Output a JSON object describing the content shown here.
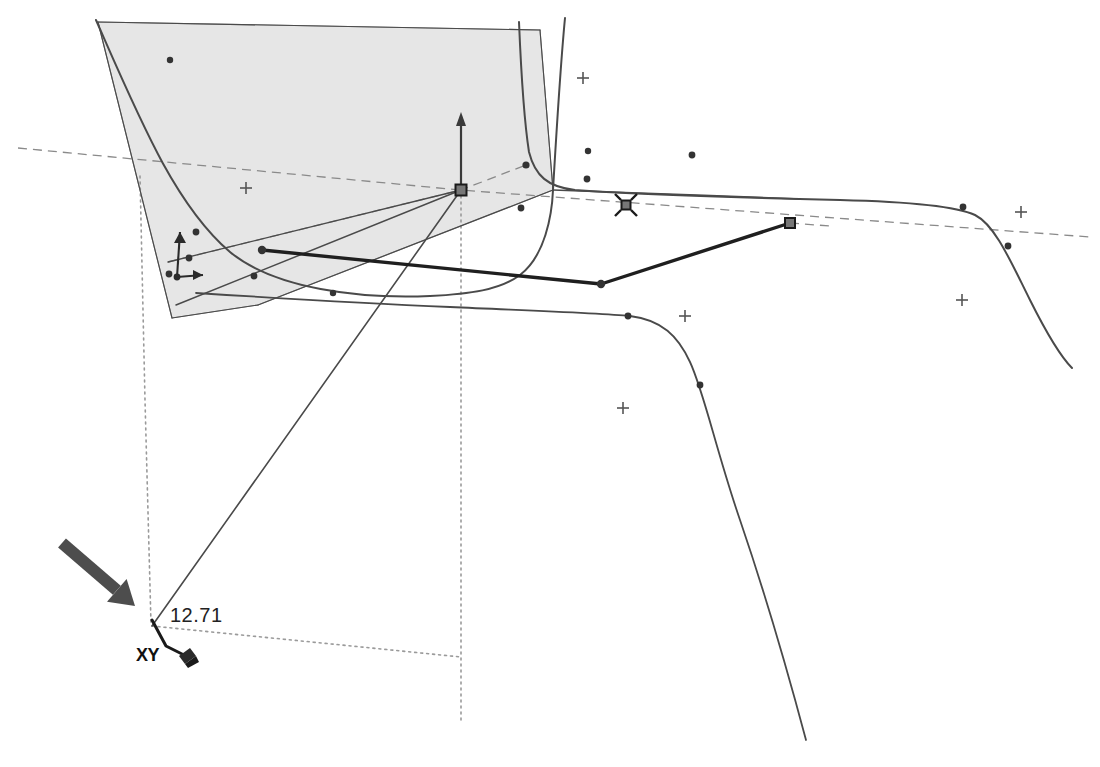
{
  "app": {
    "kind": "cad-3d-viewport",
    "background_color": "#ffffff"
  },
  "annotations": {
    "dimension_value": "12.71",
    "axis_lock_label": "XY",
    "pointer_arrow_name": "callout-arrow",
    "pencil_cursor_name": "pencil-cursor-icon"
  },
  "colors": {
    "face_fill": "#e6e6e6",
    "face_edge": "#8f8f8f",
    "geometry_stroke": "#4a4a4a",
    "selected_stroke": "#1f1f1f",
    "guide_dotted": "#9a9a9a",
    "guide_dashed": "#8a8a8a",
    "vertex_fill": "#333333",
    "handle_fill": "#555555",
    "callout_arrow": "#4d4d4d",
    "text": "#1a1a1a"
  },
  "geometry": {
    "shaded_face": {
      "name": "shaded-face-polygon",
      "points": "98,22 540,30 553,190 258,305 172,318"
    },
    "curves": [
      {
        "name": "curve-upper-left",
        "d": "M 96,20 C 140,120 175,205 230,252 C 275,289 360,299 430,296 C 470,294 500,290 520,275 C 545,256 552,215 553,190 C 556,140 560,70 565,18",
        "width": 2.0
      },
      {
        "name": "curve-top-right-sweep",
        "d": "M 519,22 C 521,70 524,120 529,152 C 535,176 548,187 575,190 C 640,195 760,198 840,200 C 920,202 960,208 975,215 C 995,225 1010,260 1030,300 C 1048,336 1062,358 1072,368",
        "width": 2.0
      },
      {
        "name": "curve-lower-right-sweep",
        "d": "M 196,293 C 260,297 360,303 450,307 C 540,311 600,313 630,316 C 662,320 678,336 690,362 C 704,392 716,450 740,520 C 766,596 790,680 806,740",
        "width": 1.8
      },
      {
        "name": "curve-right-tail",
        "d": "M 553,190 C 620,192 720,196 800,199",
        "width": 1.6
      }
    ],
    "lines": [
      {
        "name": "edge-origin-to-bottom-left",
        "x1": 461,
        "y1": 190,
        "x2": 152,
        "y2": 626,
        "width": 1.6
      },
      {
        "name": "edge-origin-to-lower-left",
        "x1": 461,
        "y1": 190,
        "x2": 176,
        "y2": 305,
        "width": 1.5
      },
      {
        "name": "edge-origin-to-left-mid",
        "x1": 461,
        "y1": 190,
        "x2": 168,
        "y2": 262,
        "width": 1.3
      },
      {
        "name": "edge-face-lower-right",
        "x1": 258,
        "y1": 305,
        "x2": 553,
        "y2": 190,
        "width": 1.2
      },
      {
        "name": "edge-face-left-diag",
        "x1": 172,
        "y1": 318,
        "x2": 98,
        "y2": 22,
        "width": 1.1
      },
      {
        "name": "edge-face-bottom",
        "x1": 172,
        "y1": 318,
        "x2": 258,
        "y2": 305,
        "width": 1.1
      },
      {
        "name": "edge-face-top",
        "x1": 98,
        "y1": 22,
        "x2": 540,
        "y2": 30,
        "width": 1.1
      },
      {
        "name": "edge-face-right",
        "x1": 540,
        "y1": 30,
        "x2": 553,
        "y2": 190,
        "width": 1.1
      }
    ],
    "selected_polyline": {
      "name": "selected-edge-polyline",
      "points": "262,250 601,284 790,223",
      "width": 3.4
    },
    "axis": {
      "name": "origin-axis-vertical",
      "x": 461,
      "y_top": 112,
      "y_bottom": 190,
      "arrow_tip_y": 112
    },
    "vertices": [
      {
        "name": "vertex",
        "x": 262,
        "y": 250,
        "r": 4.2
      },
      {
        "name": "vertex",
        "x": 601,
        "y": 284,
        "r": 4.2
      },
      {
        "name": "vertex",
        "x": 526,
        "y": 165,
        "r": 3.6
      },
      {
        "name": "vertex",
        "x": 521,
        "y": 208,
        "r": 3.4
      },
      {
        "name": "vertex",
        "x": 587,
        "y": 179,
        "r": 3.4
      },
      {
        "name": "vertex",
        "x": 588,
        "y": 151,
        "r": 3.2
      },
      {
        "name": "vertex",
        "x": 692,
        "y": 155,
        "r": 3.4
      },
      {
        "name": "vertex",
        "x": 963,
        "y": 207,
        "r": 3.4
      },
      {
        "name": "vertex",
        "x": 1008,
        "y": 246,
        "r": 3.4
      },
      {
        "name": "vertex",
        "x": 628,
        "y": 316,
        "r": 3.4
      },
      {
        "name": "vertex",
        "x": 700,
        "y": 385,
        "r": 3.4
      },
      {
        "name": "vertex",
        "x": 254,
        "y": 276,
        "r": 3.4
      },
      {
        "name": "vertex",
        "x": 196,
        "y": 232,
        "r": 3.4
      },
      {
        "name": "vertex",
        "x": 189,
        "y": 258,
        "r": 3.4
      },
      {
        "name": "vertex",
        "x": 169,
        "y": 274,
        "r": 3.4
      },
      {
        "name": "vertex",
        "x": 333,
        "y": 293,
        "r": 3.2
      },
      {
        "name": "vertex",
        "x": 170,
        "y": 60,
        "r": 3.2
      }
    ],
    "handles": [
      {
        "name": "origin-node-handle",
        "x": 461,
        "y": 190,
        "size": 11,
        "cursor": false
      },
      {
        "name": "selection-handle-with-move-cursor",
        "x": 626,
        "y": 205,
        "size": 9,
        "cursor": true
      },
      {
        "name": "selection-handle-endpoint",
        "x": 790,
        "y": 223,
        "size": 10,
        "cursor": false
      }
    ],
    "guide_crosses": [
      {
        "name": "guide-cross",
        "x": 246,
        "y": 188,
        "s": 6
      },
      {
        "name": "guide-cross",
        "x": 583,
        "y": 78,
        "s": 6
      },
      {
        "name": "guide-cross",
        "x": 685,
        "y": 316,
        "s": 6
      },
      {
        "name": "guide-cross",
        "x": 623,
        "y": 408,
        "s": 6
      },
      {
        "name": "guide-cross",
        "x": 1021,
        "y": 212,
        "s": 6
      },
      {
        "name": "guide-cross",
        "x": 962,
        "y": 300,
        "s": 6
      }
    ],
    "guides": [
      {
        "name": "guide-dashed-horizon",
        "kind": "dashed",
        "d": "M 18,148 L 460,190 L 1090,237",
        "width": 1.3
      },
      {
        "name": "guide-dashed-origin-to-upper-node",
        "kind": "dashed",
        "d": "M 168,262 L 461,190 L 526,165",
        "width": 1.3
      },
      {
        "name": "guide-dotted-vertical-left",
        "kind": "dotted",
        "d": "M 140,176 L 145,400 L 151,624",
        "width": 1.6
      },
      {
        "name": "guide-dotted-vertical-center",
        "kind": "dotted",
        "d": "M 461,190 L 461,722",
        "width": 1.6
      },
      {
        "name": "guide-dotted-base-horizontal",
        "kind": "dotted",
        "d": "M 152,626 L 461,657",
        "width": 1.6
      },
      {
        "name": "guide-dashed-handle-tail",
        "kind": "dashed",
        "d": "M 790,223 L 830,226",
        "width": 1.3
      }
    ],
    "mini_axis_indicator": {
      "name": "mini-axis-indicator",
      "origin_x": 177,
      "origin_y": 277,
      "vertical_len": 45,
      "horizontal_len": 26
    },
    "callout_arrow": {
      "name": "callout-arrow",
      "x1": 62,
      "y1": 543,
      "x2": 135,
      "y2": 606,
      "width": 12
    },
    "dim_leader": {
      "name": "dimension-leader",
      "d": "M 152,620 L 166,646 L 186,656"
    }
  }
}
